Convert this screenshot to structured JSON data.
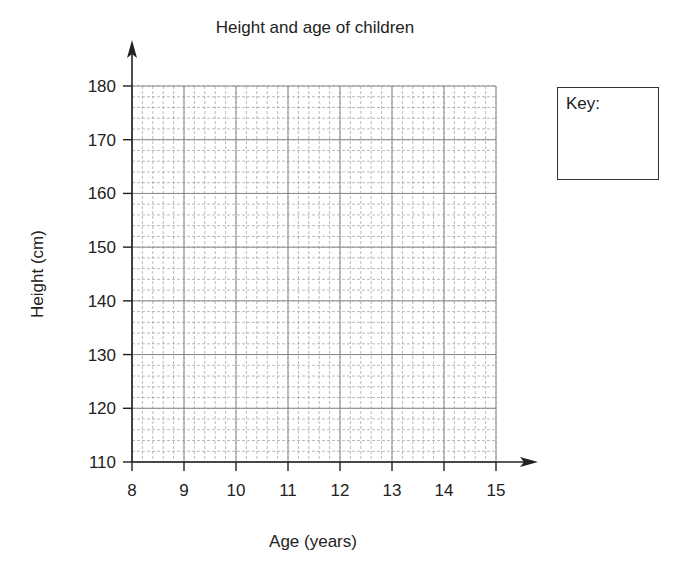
{
  "chart_data": {
    "type": "scatter",
    "title": "Height and age of children",
    "xlabel": "Age (years)",
    "ylabel": "Height (cm)",
    "x_ticks": [
      8,
      9,
      10,
      11,
      12,
      13,
      14,
      15
    ],
    "y_ticks": [
      110,
      120,
      130,
      140,
      150,
      160,
      170,
      180
    ],
    "xlim": [
      8,
      15
    ],
    "ylim": [
      110,
      180
    ],
    "grid": {
      "major": true,
      "minor": true,
      "minor_x_step": 0.2,
      "minor_y_step": 2
    },
    "series": [],
    "legend": {
      "title": "Key:",
      "position": "right",
      "entries": []
    }
  },
  "key": {
    "title": "Key:"
  },
  "colors": {
    "axis": "#222222",
    "major_grid": "#888888",
    "minor_grid": "#aaaaaa"
  }
}
